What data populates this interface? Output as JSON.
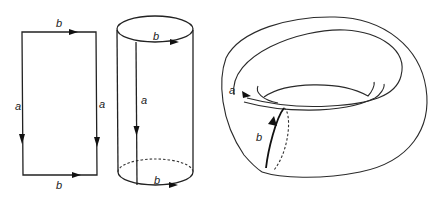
{
  "figure": {
    "panels": [
      {
        "id": "rectangle",
        "description": "Rectangle with opposite edges identified",
        "labels": {
          "top": "b",
          "bottom": "b",
          "left": "a",
          "right": "a"
        }
      },
      {
        "id": "cylinder",
        "description": "Cylinder obtained by gluing edges a",
        "labels": {
          "top": "b",
          "bottom": "b",
          "seam": "a"
        }
      },
      {
        "id": "torus",
        "description": "Torus obtained by gluing circles b",
        "labels": {
          "longitude": "a",
          "meridian": "b"
        }
      }
    ]
  }
}
